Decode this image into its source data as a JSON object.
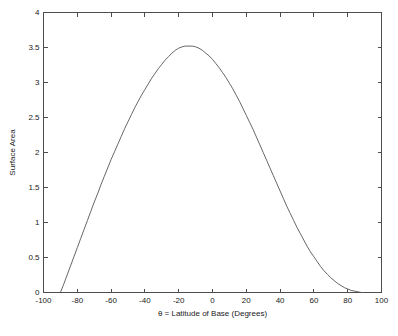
{
  "chart_data": {
    "type": "line",
    "title": "",
    "xlabel": "θ = Latitude of Base (Degrees)",
    "ylabel": "Surface Area",
    "xlim": [
      -100,
      100
    ],
    "ylim": [
      0,
      4
    ],
    "grid": false,
    "legend": null,
    "xticks": [
      -100,
      -80,
      -60,
      -40,
      -20,
      0,
      20,
      40,
      60,
      80,
      100
    ],
    "xticklabels": [
      "-100",
      "-80",
      "-60",
      "-40",
      "-20",
      "0",
      "20",
      "40",
      "60",
      "80",
      "100"
    ],
    "yticks": [
      0,
      0.5,
      1,
      1.5,
      2,
      2.5,
      3,
      3.5,
      4
    ],
    "yticklabels": [
      "0",
      "0.5",
      "1",
      "1.5",
      "2",
      "2.5",
      "3",
      "3.5",
      "4"
    ],
    "line_color": "#555555",
    "series": [
      {
        "name": "Surface Area",
        "x": [
          -90,
          -88,
          -86,
          -84,
          -82,
          -80,
          -78,
          -76,
          -74,
          -72,
          -70,
          -68,
          -66,
          -64,
          -62,
          -60,
          -58,
          -56,
          -54,
          -52,
          -50,
          -48,
          -46,
          -44,
          -42,
          -40,
          -38,
          -36,
          -34,
          -32,
          -30,
          -28,
          -26,
          -24,
          -22,
          -20,
          -18,
          -16,
          -14,
          -12,
          -10,
          -8,
          -6,
          -4,
          -2,
          0,
          2,
          4,
          6,
          8,
          10,
          12,
          14,
          16,
          18,
          20,
          22,
          24,
          26,
          28,
          30,
          32,
          34,
          36,
          38,
          40,
          42,
          44,
          46,
          48,
          50,
          52,
          54,
          56,
          58,
          60,
          62,
          64,
          66,
          68,
          70,
          72,
          74,
          76,
          78,
          80,
          82,
          84,
          86,
          88,
          90
        ],
        "y": [
          0.0,
          0.12,
          0.25,
          0.38,
          0.51,
          0.64,
          0.77,
          0.9,
          1.03,
          1.16,
          1.29,
          1.41,
          1.54,
          1.66,
          1.78,
          1.9,
          2.01,
          2.12,
          2.23,
          2.34,
          2.44,
          2.54,
          2.64,
          2.73,
          2.82,
          2.9,
          2.98,
          3.06,
          3.13,
          3.2,
          3.26,
          3.32,
          3.37,
          3.42,
          3.46,
          3.49,
          3.51,
          3.52,
          3.52,
          3.52,
          3.51,
          3.49,
          3.46,
          3.42,
          3.38,
          3.33,
          3.27,
          3.21,
          3.14,
          3.07,
          2.99,
          2.91,
          2.82,
          2.73,
          2.63,
          2.53,
          2.43,
          2.33,
          2.22,
          2.11,
          2.0,
          1.89,
          1.78,
          1.67,
          1.56,
          1.45,
          1.34,
          1.23,
          1.13,
          1.03,
          0.93,
          0.84,
          0.75,
          0.66,
          0.58,
          0.51,
          0.44,
          0.37,
          0.31,
          0.26,
          0.21,
          0.17,
          0.13,
          0.1,
          0.07,
          0.05,
          0.03,
          0.02,
          0.01,
          0.0,
          0.0
        ]
      }
    ],
    "annotations": {
      "peak_x": -16,
      "peak_y": 3.52
    }
  },
  "figure": {
    "background_color": "#ffffff",
    "axis_color": "#4d4d4d"
  }
}
